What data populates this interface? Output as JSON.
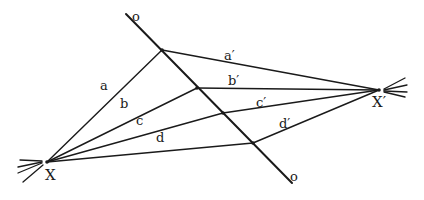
{
  "diagram": {
    "title": "",
    "colors": {
      "ink": "#1a1a1a",
      "background": "#ffffff"
    },
    "transversal": {
      "label_top": "o",
      "label_bottom": "o",
      "start": [
        126,
        14
      ],
      "end": [
        292,
        183
      ]
    },
    "points": {
      "X": {
        "label": "X",
        "pos": [
          47,
          162
        ]
      },
      "X_prime": {
        "label": "X′",
        "pos": [
          379,
          90
        ]
      },
      "pa": {
        "pos": [
          162,
          50
        ]
      },
      "pb": {
        "pos": [
          197,
          88
        ]
      },
      "pc": {
        "pos": [
          223,
          113
        ]
      },
      "pd": {
        "pos": [
          253,
          143
        ]
      }
    },
    "rays_from_X": [
      {
        "label": "a",
        "to": "pa"
      },
      {
        "label": "b",
        "to": "pb"
      },
      {
        "label": "c",
        "to": "pc"
      },
      {
        "label": "d",
        "to": "pd"
      }
    ],
    "rays_from_X_prime": [
      {
        "label": "a′",
        "to": "pa"
      },
      {
        "label": "b′",
        "to": "pb"
      },
      {
        "label": "c′",
        "to": "pc"
      },
      {
        "label": "d′",
        "to": "pd"
      }
    ],
    "labels": {
      "o_top": "o",
      "o_bottom": "o",
      "X": "X",
      "X_prime": "X′",
      "a": "a",
      "b": "b",
      "c": "c",
      "d": "d",
      "a_prime": "a′",
      "b_prime": "b′",
      "c_prime": "c′",
      "d_prime": "d′"
    }
  }
}
